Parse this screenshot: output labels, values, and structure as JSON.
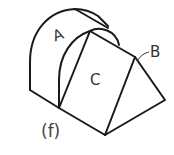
{
  "figure": {
    "type": "isometric-solid-drawing",
    "caption": "(f)",
    "labels": {
      "A": "A",
      "B": "B",
      "C": "C"
    },
    "surfaces": [
      {
        "id": "A",
        "description": "curved cylindrical surface"
      },
      {
        "id": "B",
        "description": "triangular end face"
      },
      {
        "id": "C",
        "description": "inclined rectangular face"
      }
    ],
    "colors": {
      "line": "#1a1a1a",
      "background": "#ffffff"
    }
  }
}
